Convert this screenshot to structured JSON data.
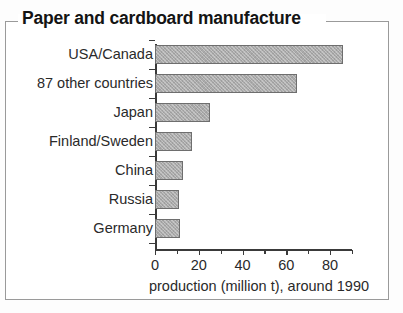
{
  "figure": {
    "title": "Paper and cardboard manufacture"
  },
  "chart_data": {
    "type": "bar",
    "orientation": "horizontal",
    "title": "Paper and cardboard manufacture",
    "categories": [
      "USA/Canada",
      "87 other countries",
      "Japan",
      "Finland/Sweden",
      "China",
      "Russia",
      "Germany"
    ],
    "values": [
      86,
      65,
      25,
      17,
      13,
      11,
      11.5
    ],
    "xlabel": "production (million t), around 1990",
    "ylabel": "",
    "xlim": [
      0,
      90
    ],
    "xticks": [
      0,
      20,
      40,
      60,
      80
    ],
    "xtick_labels": [
      "0",
      "20",
      "40",
      "60",
      "80"
    ],
    "minor_xticks": [
      10,
      30,
      50,
      70,
      90
    ],
    "grid": false,
    "legend": false,
    "bar_fill_color": "#ababab",
    "bar_edge_color": "#6e6e6e",
    "axis_color": "#3a3a3a",
    "text_color": "#2a2a2a"
  }
}
